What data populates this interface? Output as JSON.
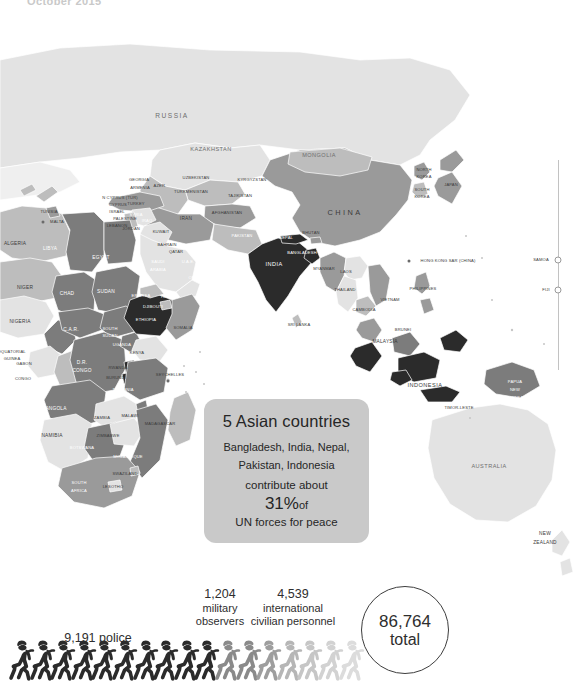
{
  "header": {
    "date": "October 2015"
  },
  "callout": {
    "headline": "5 Asian countries",
    "countries_line1": "Bangladesh, India, Nepal,",
    "countries_line2": "Pakistan, Indonesia",
    "contribute": "contribute about",
    "percent": "31%",
    "percent_suffix": "of",
    "footer": "UN forces for peace"
  },
  "stats": {
    "police": {
      "value": "9,191",
      "label": "police",
      "inline": "9,191 police"
    },
    "observers": {
      "value": "1,204",
      "label_line1": "military",
      "label_line2": "observers"
    },
    "civilians": {
      "value": "4,539",
      "label_line1": "international",
      "label_line2": "civilian personnel"
    },
    "total": {
      "value": "86,764",
      "label": "total"
    }
  },
  "chart_data": {
    "type": "map",
    "subtitle": "October 2015",
    "total": 86764,
    "legend_position": "none",
    "categories": [
      "police",
      "military observers",
      "international civilian personnel"
    ],
    "values": [
      9191,
      1204,
      4539
    ],
    "annotation": "5 Asian countries — Bangladesh, India, Nepal, Pakistan, Indonesia — contribute about 31% of UN forces for peace",
    "highlight_countries": [
      "Bangladesh",
      "India",
      "Nepal",
      "Pakistan",
      "Indonesia",
      "Ethiopia",
      "Rwanda"
    ],
    "figure_icons": {
      "dark_count": 10,
      "mid_count": 2,
      "light_count": 5,
      "glyph": "walking-soldier"
    }
  },
  "map": {
    "labels": [
      {
        "t": "RUSSIA",
        "x": 172,
        "y": 116,
        "size": "l",
        "tone": "grey"
      },
      {
        "t": "KAZAKHSTAN",
        "x": 211,
        "y": 150,
        "size": "m",
        "tone": "grey"
      },
      {
        "t": "MONGOLIA",
        "x": 319,
        "y": 156,
        "size": "m",
        "tone": "grey"
      },
      {
        "t": "CHINA",
        "x": 345,
        "y": 213,
        "size": "xl",
        "tone": "dark"
      },
      {
        "t": "UZBEKISTAN",
        "x": 196,
        "y": 178,
        "size": "xs",
        "tone": "dark"
      },
      {
        "t": "TURKMENISTAN",
        "x": 191,
        "y": 192,
        "size": "xs",
        "tone": "dark"
      },
      {
        "t": "KYRGYZSTAN",
        "x": 252,
        "y": 180,
        "size": "xs",
        "tone": "dark"
      },
      {
        "t": "TAJIKISTAN",
        "x": 240,
        "y": 196,
        "size": "xs",
        "tone": "dark"
      },
      {
        "t": "AFGHANISTAN",
        "x": 227,
        "y": 213,
        "size": "xs",
        "tone": "dark"
      },
      {
        "t": "IRAN",
        "x": 186,
        "y": 219,
        "size": "s",
        "tone": "dark"
      },
      {
        "t": "PAKISTAN",
        "x": 242,
        "y": 236,
        "size": "xs",
        "tone": "light"
      },
      {
        "t": "INDIA",
        "x": 274,
        "y": 265,
        "size": "m",
        "tone": "light"
      },
      {
        "t": "NEPAL",
        "x": 286,
        "y": 238,
        "size": "xs",
        "tone": "light"
      },
      {
        "t": "BHUTAN",
        "x": 311,
        "y": 233,
        "size": "xs",
        "tone": "dark"
      },
      {
        "t": "BANGLADESH",
        "x": 302,
        "y": 253,
        "size": "xs",
        "tone": "light"
      },
      {
        "t": "MYANMAR",
        "x": 324,
        "y": 269,
        "size": "xs",
        "tone": "dark"
      },
      {
        "t": "LAOS",
        "x": 346,
        "y": 272,
        "size": "xs",
        "tone": "dark"
      },
      {
        "t": "THAILAND",
        "x": 345,
        "y": 290,
        "size": "xs",
        "tone": "dark"
      },
      {
        "t": "VIETNAM",
        "x": 390,
        "y": 300,
        "size": "xs",
        "tone": "dark"
      },
      {
        "t": "CAMBODIA",
        "x": 364,
        "y": 310,
        "size": "xs",
        "tone": "dark"
      },
      {
        "t": "SRI LANKA",
        "x": 299,
        "y": 325,
        "size": "xs",
        "tone": "dark"
      },
      {
        "t": "MALAYSIA",
        "x": 385,
        "y": 342,
        "size": "s",
        "tone": "dark"
      },
      {
        "t": "BRUNEI",
        "x": 403,
        "y": 330,
        "size": "xs",
        "tone": "dark"
      },
      {
        "t": "INDONESIA",
        "x": 425,
        "y": 386,
        "size": "m",
        "tone": "dark"
      },
      {
        "t": "TIMOR-LESTE",
        "x": 459,
        "y": 408,
        "size": "xs",
        "tone": "dark"
      },
      {
        "t": "PAPUA",
        "x": 515,
        "y": 382,
        "size": "xs",
        "tone": "light"
      },
      {
        "t": "NEW",
        "x": 515,
        "y": 390,
        "size": "xs",
        "tone": "light"
      },
      {
        "t": "GUINEA",
        "x": 515,
        "y": 398,
        "size": "xs",
        "tone": "light"
      },
      {
        "t": "PHILIPPINES",
        "x": 423,
        "y": 289,
        "size": "xs",
        "tone": "dark"
      },
      {
        "t": "HONG KONG SAR (CHINA)",
        "x": 448,
        "y": 261,
        "size": "xs",
        "tone": "dark"
      },
      {
        "t": "NORTH",
        "x": 424,
        "y": 170,
        "size": "xs",
        "tone": "dark"
      },
      {
        "t": "KOREA",
        "x": 424,
        "y": 177,
        "size": "xs",
        "tone": "dark"
      },
      {
        "t": "SOUTH",
        "x": 422,
        "y": 190,
        "size": "xs",
        "tone": "dark"
      },
      {
        "t": "KOREA",
        "x": 422,
        "y": 197,
        "size": "xs",
        "tone": "dark"
      },
      {
        "t": "JAPAN",
        "x": 451,
        "y": 185,
        "size": "xs",
        "tone": "dark"
      },
      {
        "t": "AUSTRALIA",
        "x": 489,
        "y": 467,
        "size": "m",
        "tone": "grey"
      },
      {
        "t": "NEW",
        "x": 545,
        "y": 534,
        "size": "s",
        "tone": "dark"
      },
      {
        "t": "ZEALAND",
        "x": 545,
        "y": 543,
        "size": "s",
        "tone": "dark"
      },
      {
        "t": "SAMOA",
        "x": 541,
        "y": 260,
        "size": "xs",
        "tone": "dark"
      },
      {
        "t": "FIJI",
        "x": 546,
        "y": 290,
        "size": "xs",
        "tone": "dark"
      },
      {
        "t": "TUNISIA",
        "x": 49,
        "y": 212,
        "size": "xs",
        "tone": "dark"
      },
      {
        "t": "MALTA",
        "x": 57,
        "y": 222,
        "size": "xs",
        "tone": "dark"
      },
      {
        "t": "ALGERIA",
        "x": 15,
        "y": 244,
        "size": "s",
        "tone": "dark"
      },
      {
        "t": "LIBYA",
        "x": 50,
        "y": 249,
        "size": "s",
        "tone": "light"
      },
      {
        "t": "EGYPT",
        "x": 101,
        "y": 258,
        "size": "s",
        "tone": "light"
      },
      {
        "t": "NIGER",
        "x": 25,
        "y": 288,
        "size": "s",
        "tone": "dark"
      },
      {
        "t": "CHAD",
        "x": 67,
        "y": 294,
        "size": "s",
        "tone": "light"
      },
      {
        "t": "SUDAN",
        "x": 106,
        "y": 292,
        "size": "s",
        "tone": "light"
      },
      {
        "t": "NIGERIA",
        "x": 20,
        "y": 322,
        "size": "s",
        "tone": "dark"
      },
      {
        "t": "C.A.R.",
        "x": 71,
        "y": 330,
        "size": "s",
        "tone": "light"
      },
      {
        "t": "SOUTH",
        "x": 110,
        "y": 329,
        "size": "xs",
        "tone": "light"
      },
      {
        "t": "SUDAN",
        "x": 110,
        "y": 336,
        "size": "xs",
        "tone": "light"
      },
      {
        "t": "CAMEROON",
        "x": 33,
        "y": 344,
        "size": "xs",
        "tone": "light"
      },
      {
        "t": "EQUATORIAL",
        "x": 12,
        "y": 352,
        "size": "xs",
        "tone": "dark"
      },
      {
        "t": "GUINEA",
        "x": 12,
        "y": 359,
        "size": "xs",
        "tone": "dark"
      },
      {
        "t": "GABON",
        "x": 24,
        "y": 364,
        "size": "xs",
        "tone": "dark"
      },
      {
        "t": "CONGO",
        "x": 23,
        "y": 379,
        "size": "xs",
        "tone": "dark"
      },
      {
        "t": "D.R.",
        "x": 82,
        "y": 363,
        "size": "s",
        "tone": "light"
      },
      {
        "t": "CONGO",
        "x": 82,
        "y": 371,
        "size": "s",
        "tone": "light"
      },
      {
        "t": "UGANDA",
        "x": 122,
        "y": 345,
        "size": "xs",
        "tone": "light"
      },
      {
        "t": "KENYA",
        "x": 137,
        "y": 353,
        "size": "xs",
        "tone": "dark"
      },
      {
        "t": "RWANDA",
        "x": 118,
        "y": 368,
        "size": "xs",
        "tone": "dark"
      },
      {
        "t": "BURUNDI",
        "x": 116,
        "y": 378,
        "size": "xs",
        "tone": "dark"
      },
      {
        "t": "TANZANIA",
        "x": 123,
        "y": 390,
        "size": "xs",
        "tone": "light"
      },
      {
        "t": "ANGOLA",
        "x": 56,
        "y": 409,
        "size": "s",
        "tone": "light"
      },
      {
        "t": "ZAMBIA",
        "x": 102,
        "y": 418,
        "size": "xs",
        "tone": "dark"
      },
      {
        "t": "MALAWI",
        "x": 130,
        "y": 416,
        "size": "xs",
        "tone": "dark"
      },
      {
        "t": "NAMIBIA",
        "x": 52,
        "y": 436,
        "size": "s",
        "tone": "dark"
      },
      {
        "t": "ZIMBABWE",
        "x": 108,
        "y": 436,
        "size": "xs",
        "tone": "dark"
      },
      {
        "t": "BOTSWANA",
        "x": 82,
        "y": 448,
        "size": "xs",
        "tone": "light"
      },
      {
        "t": "MOZAMBIQUE",
        "x": 128,
        "y": 457,
        "size": "xs",
        "tone": "light"
      },
      {
        "t": "SWAZILAND",
        "x": 125,
        "y": 474,
        "size": "xs",
        "tone": "dark"
      },
      {
        "t": "LESOTHO",
        "x": 113,
        "y": 487,
        "size": "xs",
        "tone": "dark"
      },
      {
        "t": "SOUTH",
        "x": 79,
        "y": 483,
        "size": "xs",
        "tone": "light"
      },
      {
        "t": "AFRICA",
        "x": 79,
        "y": 491,
        "size": "xs",
        "tone": "light"
      },
      {
        "t": "MADAGASCAR",
        "x": 160,
        "y": 424,
        "size": "xs",
        "tone": "dark"
      },
      {
        "t": "SEYCHELLES",
        "x": 170,
        "y": 375,
        "size": "xs",
        "tone": "dark"
      },
      {
        "t": "SOMALIA",
        "x": 183,
        "y": 328,
        "size": "xs",
        "tone": "dark"
      },
      {
        "t": "ETHIOPIA",
        "x": 146,
        "y": 320,
        "size": "xs",
        "tone": "light"
      },
      {
        "t": "DJIBOUTI",
        "x": 153,
        "y": 307,
        "size": "xs",
        "tone": "light"
      },
      {
        "t": "ERITREA",
        "x": 141,
        "y": 296,
        "size": "xs",
        "tone": "light"
      },
      {
        "t": "YEMEN",
        "x": 168,
        "y": 297,
        "size": "xs",
        "tone": "light"
      },
      {
        "t": "SAUDI",
        "x": 158,
        "y": 262,
        "size": "xs",
        "tone": "light"
      },
      {
        "t": "ARABIA",
        "x": 158,
        "y": 270,
        "size": "xs",
        "tone": "light"
      },
      {
        "t": "U.A.E.",
        "x": 188,
        "y": 262,
        "size": "xs",
        "tone": "light"
      },
      {
        "t": "OMAN",
        "x": 195,
        "y": 278,
        "size": "xs",
        "tone": "light"
      },
      {
        "t": "N CYPRUS (TUR)",
        "x": 120,
        "y": 198,
        "size": "xs",
        "tone": "dark"
      },
      {
        "t": "CYPRUS",
        "x": 118,
        "y": 205,
        "size": "xs",
        "tone": "dark"
      },
      {
        "t": "ISRAEL",
        "x": 117,
        "y": 212,
        "size": "xs",
        "tone": "dark"
      },
      {
        "t": "PALESTINE",
        "x": 125,
        "y": 219,
        "size": "xs",
        "tone": "dark"
      },
      {
        "t": "LEBANON",
        "x": 117,
        "y": 226,
        "size": "xs",
        "tone": "dark"
      },
      {
        "t": "SYRIA",
        "x": 136,
        "y": 215,
        "size": "xs",
        "tone": "light"
      },
      {
        "t": "IRAQ",
        "x": 147,
        "y": 221,
        "size": "xs",
        "tone": "light"
      },
      {
        "t": "JORDAN",
        "x": 131,
        "y": 229,
        "size": "xs",
        "tone": "dark"
      },
      {
        "t": "KUWAIT",
        "x": 161,
        "y": 232,
        "size": "xs",
        "tone": "dark"
      },
      {
        "t": "BAHRAIN",
        "x": 167,
        "y": 245,
        "size": "xs",
        "tone": "dark"
      },
      {
        "t": "QATAR",
        "x": 176,
        "y": 252,
        "size": "xs",
        "tone": "dark"
      },
      {
        "t": "GEORGIA",
        "x": 139,
        "y": 180,
        "size": "xs",
        "tone": "dark"
      },
      {
        "t": "ARMENIA",
        "x": 140,
        "y": 188,
        "size": "xs",
        "tone": "dark"
      },
      {
        "t": "AZER.",
        "x": 160,
        "y": 186,
        "size": "xs",
        "tone": "dark"
      },
      {
        "t": "TURKEY",
        "x": 136,
        "y": 204,
        "size": "xs",
        "tone": "dark"
      }
    ],
    "colors": {
      "ocean": "#ffffff",
      "land_light": "#e0e0e0",
      "land_mid": "#b9b9b9",
      "land_dark": "#8f8f8f",
      "land_darker": "#6a6a6a",
      "highlight": "#2a2a2a",
      "callout_bg": "#c9c9c9",
      "text": "#2e2e2e"
    }
  }
}
